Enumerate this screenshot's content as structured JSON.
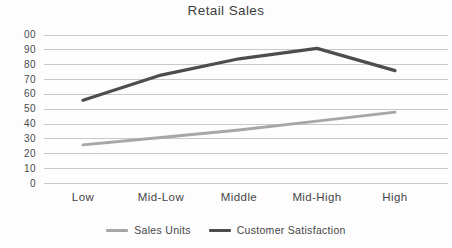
{
  "chart_data": {
    "type": "line",
    "title": "Retail Sales",
    "categories": [
      "Low",
      "Mid-Low",
      "Middle",
      "Mid-High",
      "High"
    ],
    "series": [
      {
        "name": "Sales Units",
        "values": [
          26,
          31,
          36,
          42,
          48
        ],
        "color": "#a6a6a6"
      },
      {
        "name": "Customer Satisfaction",
        "values": [
          56,
          73,
          84,
          91,
          76
        ],
        "color": "#4d4d4d"
      }
    ],
    "ylim": [
      0,
      100
    ],
    "y_tick_step": 10,
    "y_tick_display_top_to_bottom": [
      "00",
      "90",
      "80",
      "70",
      "60",
      "50",
      "40",
      "30",
      "20",
      "10",
      "0"
    ],
    "grid": "horizontal",
    "gridline_color": "#c9c9c9",
    "legend_position": "bottom",
    "xlabel": "",
    "ylabel": ""
  }
}
